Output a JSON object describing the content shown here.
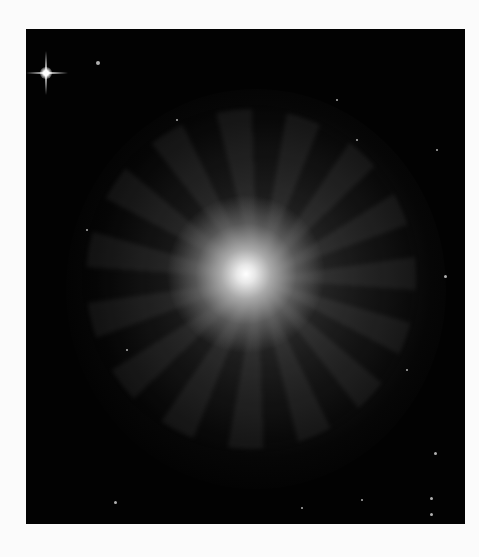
{
  "image": {
    "subject": "spiral galaxy",
    "alt": "Face-on spiral galaxy with a bright central bulge and tightly wound spiral arms against a black star field; a bright foreground star with diffraction spikes in the upper-left corner",
    "colors": {
      "background": "#fbfbfb",
      "sky": "#020202",
      "core": "#ffffff",
      "arms": "#6e6e6e"
    }
  }
}
